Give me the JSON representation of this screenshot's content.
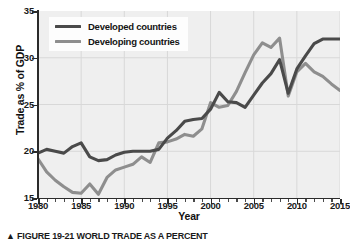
{
  "chart_data": {
    "type": "line",
    "title": "",
    "xlabel": "Year",
    "ylabel": "Trade as % of GDP",
    "xlim": [
      1980,
      2015
    ],
    "ylim": [
      15,
      35
    ],
    "yticks": [
      15,
      20,
      25,
      30,
      35
    ],
    "xticks": [
      1980,
      1985,
      1990,
      1995,
      2000,
      2005,
      2010,
      2015
    ],
    "xtick_minor_step": 1,
    "grid": true,
    "legend_position": "top-left",
    "x": [
      1980,
      1981,
      1982,
      1983,
      1984,
      1985,
      1986,
      1987,
      1988,
      1989,
      1990,
      1991,
      1992,
      1993,
      1994,
      1995,
      1996,
      1997,
      1998,
      1999,
      2000,
      2001,
      2002,
      2003,
      2004,
      2005,
      2006,
      2007,
      2008,
      2009,
      2010,
      2011,
      2012,
      2013,
      2014,
      2015
    ],
    "series": [
      {
        "name": "Developed countries",
        "color": "#4a4a4a",
        "values": [
          19.8,
          20.2,
          20.0,
          19.8,
          20.5,
          20.9,
          19.4,
          19.0,
          19.1,
          19.6,
          19.9,
          20.0,
          20.0,
          20.0,
          20.2,
          21.4,
          22.2,
          23.2,
          23.4,
          23.5,
          24.5,
          26.3,
          25.3,
          25.2,
          24.7,
          26.0,
          27.3,
          28.3,
          29.8,
          26.2,
          28.8,
          30.2,
          31.5,
          32.0,
          32.0,
          32.0
        ]
      },
      {
        "name": "Developing countries",
        "color": "#8e8e8e",
        "values": [
          19.2,
          17.8,
          16.9,
          16.2,
          15.6,
          15.5,
          16.5,
          15.4,
          17.2,
          18.0,
          18.3,
          18.6,
          19.4,
          18.8,
          20.9,
          21.0,
          21.3,
          21.8,
          21.6,
          22.4,
          25.2,
          24.7,
          24.9,
          26.4,
          28.4,
          30.3,
          31.6,
          31.1,
          32.1,
          25.9,
          28.5,
          29.4,
          28.5,
          28.0,
          27.2,
          26.5
        ]
      }
    ]
  },
  "legend": {
    "items": [
      {
        "label": "Developed countries",
        "color": "#4a4a4a"
      },
      {
        "label": "Developing countries",
        "color": "#8e8e8e"
      }
    ]
  },
  "axes": {
    "y_title": "Trade as % of GDP",
    "x_title": "Year",
    "y_labels": [
      "35",
      "30",
      "25",
      "20",
      "15"
    ],
    "x_labels": [
      "1980",
      "1985",
      "1990",
      "1995",
      "2000",
      "2005",
      "2010",
      "2015"
    ]
  },
  "caption": {
    "marker": "▲",
    "text": "FIGURE 19-21 WORLD TRADE AS A PERCENT"
  },
  "colors": {
    "plot_background": "#efefef",
    "axis": "#2b2b2b",
    "grid": "#d8d8d8",
    "developed": "#4a4a4a",
    "developing": "#8e8e8e"
  }
}
